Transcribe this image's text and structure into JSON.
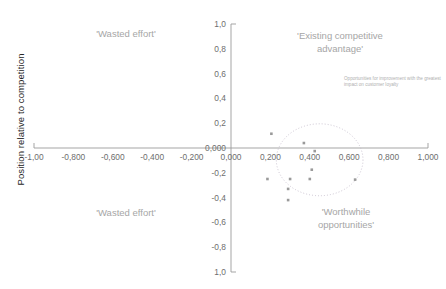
{
  "chart_data": {
    "type": "scatter",
    "title": "",
    "xlabel": "",
    "ylabel": "Position relative to competition",
    "xlim": [
      -1.0,
      1.0
    ],
    "ylim": [
      -1.0,
      1.0
    ],
    "grid": false,
    "legend": null,
    "x_ticks": [
      -1.0,
      -0.8,
      -0.6,
      -0.4,
      -0.2,
      0.0,
      0.2,
      0.4,
      0.6,
      0.8,
      1.0
    ],
    "x_tick_labels": [
      "-1,00",
      "-0,800",
      "-0,600",
      "-0,400",
      "-0,200",
      "0,000",
      "0,200",
      "0,400",
      "0,600",
      "0,800",
      "1,000"
    ],
    "y_ticks": [
      1.0,
      0.8,
      0.6,
      0.4,
      0.2,
      0.0,
      -0.2,
      -0.4,
      -0.6,
      -0.8,
      -1.0
    ],
    "y_tick_labels": [
      "1,0",
      "0,8",
      "0,6",
      "0,4",
      "0,2",
      "0,000",
      "-0,2",
      "-0,4",
      "-0,6",
      "-0,8",
      "1,0"
    ],
    "point_color": "#9a9a9a",
    "points": [
      {
        "x": 0.205,
        "y": 0.115
      },
      {
        "x": 0.37,
        "y": 0.04
      },
      {
        "x": 0.425,
        "y": -0.025
      },
      {
        "x": 0.41,
        "y": -0.175
      },
      {
        "x": 0.185,
        "y": -0.25
      },
      {
        "x": 0.3,
        "y": -0.25
      },
      {
        "x": 0.4,
        "y": -0.25
      },
      {
        "x": 0.63,
        "y": -0.255
      },
      {
        "x": 0.29,
        "y": -0.33
      },
      {
        "x": 0.29,
        "y": -0.42
      }
    ],
    "highlight_ellipse": {
      "cx": 0.45,
      "cy": -0.095,
      "rx": 0.22,
      "ry": 0.29,
      "style": "dotted",
      "color": "#c0b8c8"
    },
    "annotations": [
      {
        "id": "opportunities-note",
        "text": "Opportunities for improvement with the greatest impact on customer loyalty",
        "x": 0.53,
        "y": 0.42
      }
    ],
    "quadrant_labels": [
      {
        "id": "wasted-effort-top-left",
        "text": "'Wasted effort'",
        "quadrant": "top-left"
      },
      {
        "id": "existing-competitive-advantage",
        "text": "'Existing competitive\nadvantage'",
        "quadrant": "top-right"
      },
      {
        "id": "wasted-effort-bottom-left",
        "text": "'Wasted effort'",
        "quadrant": "bottom-left"
      },
      {
        "id": "worthwhile-opportunities",
        "text": "'Worthwhile\nopportunities'",
        "quadrant": "bottom-right"
      }
    ]
  },
  "axis_title": {
    "y": "Position relative to competition"
  },
  "colors": {
    "axis": "#9b9b9b",
    "point": "#9a9a9a",
    "quadrant_text": "#a6a6a6",
    "tick_text": "#6e6e6e",
    "ellipse": "#c0b8c8",
    "annotation_text": "#b0b0b0",
    "background": "#ffffff"
  }
}
